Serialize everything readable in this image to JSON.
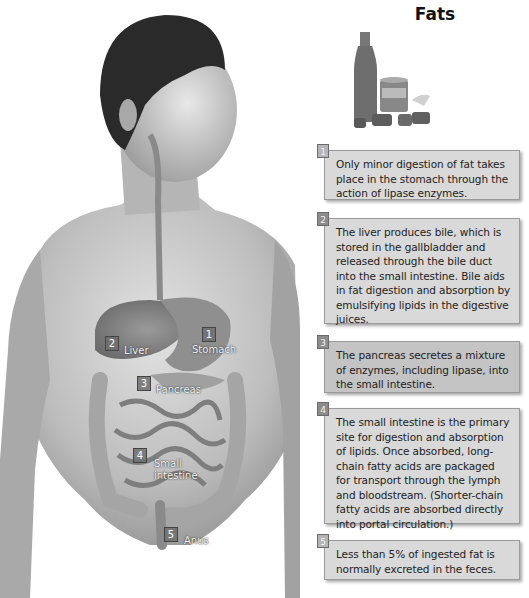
{
  "title": "Fats",
  "illustration": {
    "subject": "human-torso-digestive-system",
    "organ_labels": [
      {
        "number": "1",
        "label": "Stomach"
      },
      {
        "number": "2",
        "label": "Liver"
      },
      {
        "number": "3",
        "label": "Pancreas"
      },
      {
        "number": "4",
        "label": "Small intestine",
        "label_line1": "Small",
        "label_line2": "intestine"
      },
      {
        "number": "5",
        "label": "Anus"
      }
    ]
  },
  "products_image": "fat-foods-bottle-jar-butter",
  "steps": [
    {
      "number": "1",
      "text": "Only minor digestion of fat takes place in the stomach through the action of lipase enzymes."
    },
    {
      "number": "2",
      "text": "The liver produces bile, which is stored in the gallbladder and released through the bile duct into the small intestine. Bile aids in fat digestion and absorption by emulsifying lipids in the digestive juices."
    },
    {
      "number": "3",
      "text": "The pancreas secretes a mixture of enzymes, including lipase, into the small intestine."
    },
    {
      "number": "4",
      "text": "The small intestine is the primary site for digestion and absorption of lipids. Once absorbed, long-chain fatty acids are packaged for transport through the lymph and bloodstream. (Shorter-chain fatty acids are absorbed directly into portal circulation.)"
    },
    {
      "number": "5",
      "text": "Less than 5% of ingested fat is normally excreted in the feces."
    }
  ],
  "colors": {
    "box_light": "#d9d9d9",
    "box_dark": "#c4c4c4",
    "badge": "#8c8c8c"
  }
}
